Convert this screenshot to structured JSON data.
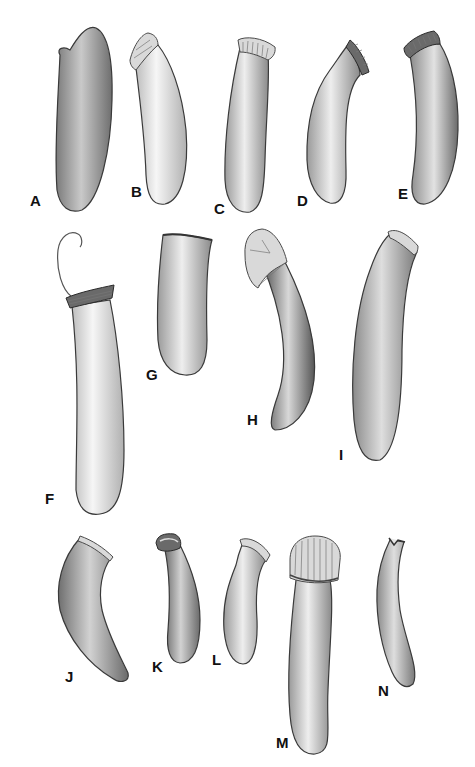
{
  "plate": {
    "background": "#ffffff",
    "figures": [
      {
        "id": "A",
        "label": "A",
        "shade": "#9a9a9a",
        "rim": "none"
      },
      {
        "id": "B",
        "label": "B",
        "shade": "#e6e6e6",
        "rim": "folded"
      },
      {
        "id": "C",
        "label": "C",
        "shade": "#cfcfcf",
        "rim": "ribbed"
      },
      {
        "id": "D",
        "label": "D",
        "shade": "#d4d4d4",
        "rim": "ribbed"
      },
      {
        "id": "E",
        "label": "E",
        "shade": "#c4c4c4",
        "rim": "dark-ribbed"
      },
      {
        "id": "F",
        "label": "F",
        "shade": "#dcdcdc",
        "rim": "ringed-with-thread"
      },
      {
        "id": "G",
        "label": "G",
        "shade": "#d8d8d8",
        "rim": "plain"
      },
      {
        "id": "H",
        "label": "H",
        "shade": "#8e8e8e",
        "rim": "folded"
      },
      {
        "id": "I",
        "label": "I",
        "shade": "#bdbdbd",
        "rim": "rolled"
      },
      {
        "id": "J",
        "label": "J",
        "shade": "#a5a5a5",
        "rim": "banded"
      },
      {
        "id": "K",
        "label": "K",
        "shade": "#b5b5b5",
        "rim": "rolled"
      },
      {
        "id": "L",
        "label": "L",
        "shade": "#c6c6c6",
        "rim": "flared"
      },
      {
        "id": "M",
        "label": "M",
        "shade": "#d0d0d0",
        "rim": "large-ribbed-cap"
      },
      {
        "id": "N",
        "label": "N",
        "shade": "#b8b8b8",
        "rim": "notched"
      }
    ]
  }
}
